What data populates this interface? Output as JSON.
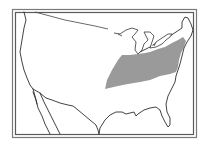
{
  "map": {
    "region": "Contiguous United States",
    "style": "black-and-white outline map with double-line frame",
    "layers": [
      {
        "name": "country-outline",
        "type": "line",
        "color": "#2e2e2e"
      },
      {
        "name": "great-lakes",
        "type": "polygon",
        "color": "#ffffff"
      },
      {
        "name": "species-range",
        "type": "polygon",
        "color": "#9a9a9a",
        "description": "Shaded distribution band from the lower Midwest across the Ohio Valley to the mid-Atlantic and New England coast"
      }
    ],
    "colors": {
      "range_fill": "#9a9a9a",
      "outline": "#2e2e2e",
      "frame": "#6a6a6a",
      "background": "#ffffff"
    },
    "labels": []
  }
}
